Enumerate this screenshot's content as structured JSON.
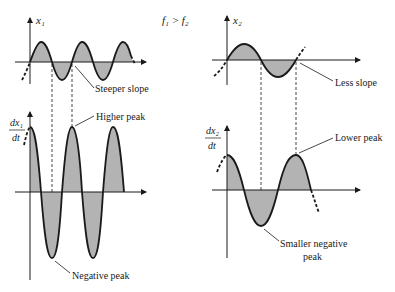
{
  "figure": {
    "condition": "f₁ > f₂",
    "left": {
      "top_axis_label": "x₁",
      "bottom_axis_label_num": "dx₁",
      "bottom_axis_label_den": "dt",
      "annotations": {
        "steeper_slope": "Steeper slope",
        "higher_peak": "Higher peak",
        "negative_peak": "Negative peak"
      }
    },
    "right": {
      "top_axis_label": "x₂",
      "bottom_axis_label_num": "dx₂",
      "bottom_axis_label_den": "dt",
      "annotations": {
        "less_slope": "Less slope",
        "lower_peak": "Lower peak",
        "smaller_negative_peak_line1": "Smaller negative",
        "smaller_negative_peak_line2": "peak"
      }
    },
    "colors": {
      "curve": "#1a1a1a",
      "fill": "#b3b3b3",
      "axis": "#1a1a1a"
    }
  }
}
